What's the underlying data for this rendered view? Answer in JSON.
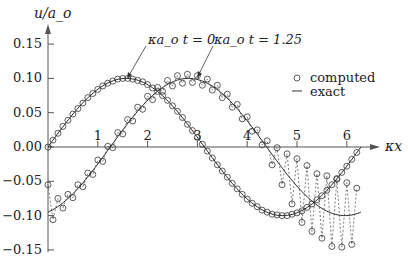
{
  "chart_data": {
    "type": "line",
    "title": "",
    "xlabel": "κx",
    "ylabel": "u/a_o",
    "xlim": [
      0,
      6.6
    ],
    "ylim": [
      -0.15,
      0.15
    ],
    "grid": false,
    "legend_position": "upper right",
    "x_ticks": [
      1,
      2,
      3,
      4,
      5,
      6
    ],
    "x_tick_labels": [
      "1",
      "2",
      "3",
      "4",
      "5",
      "6"
    ],
    "y_ticks": [
      0.15,
      0.1,
      0.05,
      0.0,
      -0.05,
      -0.1,
      -0.15
    ],
    "y_tick_labels": [
      "0.15",
      "0.10",
      "0.05",
      "0.00",
      "−0.05",
      "−0.10",
      "−0.15"
    ],
    "legend": [
      {
        "marker": "circle",
        "label": "computed"
      },
      {
        "marker": "line",
        "label": "exact"
      }
    ],
    "annotations": [
      {
        "text": "κa_o t = 0",
        "points_to": [
          1.57,
          0.1
        ]
      },
      {
        "text": "κa_o t = 1.25",
        "points_to": [
          2.98,
          0.1
        ]
      }
    ],
    "x": [
      0.0,
      0.1,
      0.2,
      0.3,
      0.4,
      0.5,
      0.6,
      0.7,
      0.8,
      0.9,
      1.0,
      1.1,
      1.2,
      1.3,
      1.4,
      1.5,
      1.6,
      1.7,
      1.8,
      1.9,
      2.0,
      2.1,
      2.2,
      2.3,
      2.4,
      2.5,
      2.6,
      2.7,
      2.8,
      2.9,
      3.0,
      3.1,
      3.2,
      3.3,
      3.4,
      3.5,
      3.6,
      3.7,
      3.8,
      3.9,
      4.0,
      4.1,
      4.2,
      4.3,
      4.4,
      4.5,
      4.6,
      4.7,
      4.8,
      4.9,
      5.0,
      5.1,
      5.2,
      5.3,
      5.4,
      5.5,
      5.6,
      5.7,
      5.8,
      5.9,
      6.0,
      6.1,
      6.2
    ],
    "series": [
      {
        "name": "exact, κa_o t = 0",
        "style": "line",
        "formula": "0.1*sin(κx)"
      },
      {
        "name": "exact, κa_o t = 1.25",
        "style": "line",
        "formula": "0.1*sin(κx - 1.25)"
      },
      {
        "name": "computed, κa_o t = 0",
        "style": "circle",
        "values": [
          0.0,
          0.01,
          0.02,
          0.03,
          0.039,
          0.048,
          0.056,
          0.064,
          0.072,
          0.078,
          0.084,
          0.089,
          0.093,
          0.096,
          0.099,
          0.1,
          0.1,
          0.099,
          0.097,
          0.095,
          0.091,
          0.086,
          0.081,
          0.075,
          0.068,
          0.06,
          0.052,
          0.043,
          0.033,
          0.024,
          0.014,
          0.004,
          -0.006,
          -0.016,
          -0.026,
          -0.035,
          -0.044,
          -0.053,
          -0.061,
          -0.069,
          -0.076,
          -0.082,
          -0.087,
          -0.092,
          -0.095,
          -0.098,
          -0.099,
          -0.1,
          -0.1,
          -0.098,
          -0.096,
          -0.093,
          -0.088,
          -0.083,
          -0.077,
          -0.071,
          -0.063,
          -0.055,
          -0.046,
          -0.037,
          -0.028,
          -0.018,
          -0.008
        ]
      },
      {
        "name": "computed, κa_o t = 1.25",
        "style": "circle-dashed",
        "values": [
          -0.055,
          -0.106,
          -0.075,
          -0.089,
          -0.069,
          -0.074,
          -0.055,
          -0.058,
          -0.038,
          -0.04,
          -0.019,
          -0.021,
          0.001,
          -0.001,
          0.021,
          0.019,
          0.04,
          0.038,
          0.058,
          0.055,
          0.074,
          0.069,
          0.087,
          0.081,
          0.097,
          0.089,
          0.104,
          0.093,
          0.106,
          0.094,
          0.104,
          0.09,
          0.099,
          0.083,
          0.09,
          0.072,
          0.077,
          0.058,
          0.062,
          0.041,
          0.044,
          0.023,
          0.025,
          0.003,
          0.009,
          -0.026,
          -0.001,
          -0.055,
          -0.01,
          -0.083,
          -0.017,
          -0.11,
          -0.027,
          -0.123,
          -0.039,
          -0.133,
          -0.042,
          -0.145,
          -0.047,
          -0.146,
          -0.052,
          -0.142,
          -0.06
        ]
      }
    ]
  }
}
